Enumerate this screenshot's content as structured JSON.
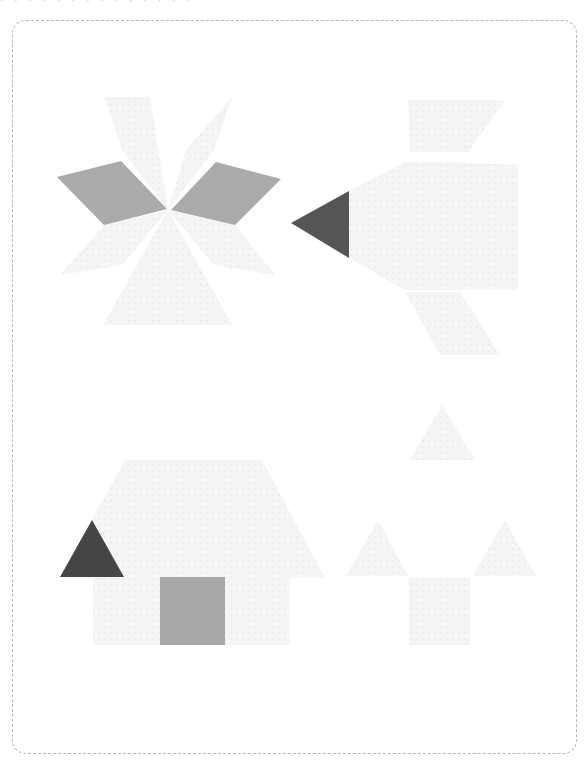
{
  "page": {
    "header_fragment": "· · ·   · · ·   · ·   · ·   · ·   · ·"
  },
  "colors": {
    "ghost_fill": "#f4f4f4",
    "ghost_dots": "#ebebeb",
    "piece_light": "#ababab",
    "piece_dark": "#555555",
    "piece_darker": "#454545",
    "border": "#b5b5b5"
  },
  "puzzles": [
    {
      "name": "star",
      "outline_hint": "faint six-point star made of rhombi and a triangle",
      "pieces": [
        {
          "shape": "rhombus",
          "color": "piece_light",
          "points": "57,177 121,161 167,209 104,225"
        },
        {
          "shape": "rhombus",
          "color": "piece_light",
          "points": "171,210 216,162 281,179 235,225"
        }
      ]
    },
    {
      "name": "fish",
      "outline_hint": "faint fish made of hexagon, rhombi and trapezoid",
      "pieces": [
        {
          "shape": "triangle",
          "color": "piece_dark",
          "points": "291,223 349,191 349,258"
        }
      ]
    },
    {
      "name": "house",
      "outline_hint": "faint house with trapezoid roof and rectangular body",
      "pieces": [
        {
          "shape": "triangle",
          "color": "piece_darker",
          "points": "60,577 92,520 124,577"
        },
        {
          "shape": "square",
          "color": "piece_light",
          "points": "160,577 225,577 225,645 160,645"
        }
      ]
    },
    {
      "name": "figure",
      "outline_hint": "faint figure of three triangles and a square",
      "pieces": []
    }
  ]
}
